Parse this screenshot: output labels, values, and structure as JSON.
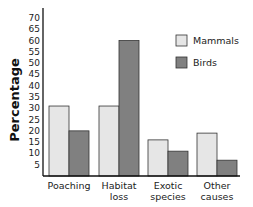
{
  "chart_data": {
    "type": "bar",
    "title": "",
    "xlabel": "",
    "ylabel": "Percentage",
    "ylim": [
      0,
      70
    ],
    "yticks": [
      5,
      10,
      15,
      20,
      25,
      30,
      35,
      40,
      45,
      50,
      55,
      60,
      65,
      70
    ],
    "grid": false,
    "legend_position": "upper right",
    "categories": [
      [
        "Poaching"
      ],
      [
        "Habitat",
        "loss"
      ],
      [
        "Exotic",
        "species"
      ],
      [
        "Other",
        "causes"
      ]
    ],
    "series": [
      {
        "name": "Mammals",
        "color": "#e6e6e6",
        "values": [
          31,
          31,
          16,
          19
        ]
      },
      {
        "name": "Birds",
        "color": "#808080",
        "values": [
          20,
          60,
          11,
          7
        ]
      }
    ]
  }
}
